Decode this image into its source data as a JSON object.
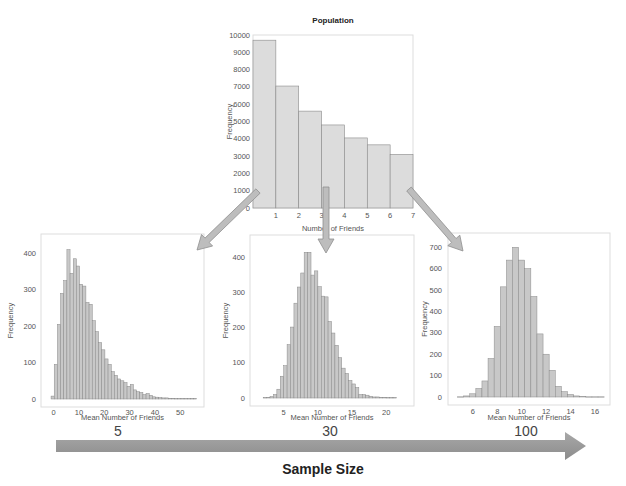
{
  "colors": {
    "bar_fill_population": "#dcdcdc",
    "bar_fill_sample": "#c8c8c8",
    "bar_stroke": "#8a8a8a",
    "frame": "#dddddd",
    "tick_text": "#555555",
    "arrow_fill": "#bdbdbd",
    "arrow_stroke": "#8f8f8f",
    "big_arrow": "#9a9a9a"
  },
  "chart_data": [
    {
      "id": "population",
      "type": "bar",
      "title": "Population",
      "xlabel": "Number of Friends",
      "ylabel": "Frequency",
      "categories": [
        "0-1",
        "1-2",
        "2-3",
        "3-4",
        "4-5",
        "5-6",
        "6-7"
      ],
      "bin_edges": [
        0,
        1,
        2,
        3,
        4,
        5,
        6,
        7
      ],
      "values": [
        9700,
        7050,
        5600,
        4800,
        4050,
        3650,
        3100
      ],
      "xticks": [
        1,
        2,
        3,
        4,
        5,
        6,
        7
      ],
      "yticks": [
        0,
        1000,
        2000,
        3000,
        4000,
        5000,
        6000,
        7000,
        8000,
        9000,
        10000
      ],
      "xlim": [
        0,
        7
      ],
      "ylim": [
        0,
        10000
      ],
      "grid": false
    },
    {
      "id": "sample5",
      "type": "bar",
      "title": "",
      "caption": "5",
      "xlabel": "Mean Number of Friends",
      "ylabel": "Frequency",
      "bin_start": -1.0,
      "bin_width": 1.25,
      "values": [
        8,
        95,
        205,
        290,
        325,
        410,
        345,
        385,
        365,
        315,
        310,
        265,
        260,
        215,
        185,
        155,
        135,
        110,
        95,
        75,
        65,
        55,
        50,
        45,
        35,
        40,
        25,
        20,
        18,
        12,
        15,
        10,
        6,
        5,
        4,
        3,
        3,
        2,
        2,
        1,
        1,
        1,
        1,
        1,
        1,
        1
      ],
      "xticks": [
        0,
        10,
        20,
        30,
        40,
        50
      ],
      "yticks": [
        0,
        100,
        200,
        300,
        400
      ],
      "xlim": [
        -3,
        57
      ],
      "ylim": [
        0,
        420
      ],
      "grid": false
    },
    {
      "id": "sample30",
      "type": "bar",
      "title": "",
      "caption": "30",
      "xlabel": "Mean Number of Friends",
      "ylabel": "Frequency",
      "bin_start": 2.0,
      "bin_width": 0.5,
      "values": [
        1,
        2,
        4,
        10,
        25,
        62,
        92,
        152,
        202,
        270,
        316,
        356,
        415,
        415,
        350,
        362,
        317,
        290,
        288,
        218,
        185,
        150,
        115,
        85,
        70,
        50,
        40,
        30,
        10,
        10,
        8,
        5,
        3,
        3,
        2,
        2,
        1,
        1,
        1
      ],
      "xticks": [
        5,
        10,
        15,
        20
      ],
      "yticks": [
        0,
        100,
        200,
        300,
        400
      ],
      "xlim": [
        0.8,
        23.2
      ],
      "ylim": [
        0,
        430
      ],
      "grid": false
    },
    {
      "id": "sample100",
      "type": "bar",
      "title": "",
      "caption": "100",
      "xlabel": "Mean Number of Friends",
      "ylabel": "Frequency",
      "bin_start": 4.75,
      "bin_width": 0.5,
      "values": [
        1,
        5,
        15,
        40,
        75,
        180,
        330,
        515,
        640,
        700,
        640,
        600,
        470,
        295,
        200,
        125,
        50,
        25,
        12,
        5,
        2,
        1,
        1,
        1
      ],
      "xticks": [
        6,
        8,
        10,
        12,
        14,
        16
      ],
      "yticks": [
        0,
        100,
        200,
        300,
        400,
        500,
        600,
        700
      ],
      "xlim": [
        4.3,
        16.9
      ],
      "ylim": [
        0,
        720
      ],
      "grid": false
    }
  ],
  "captions": {
    "population_title": "Population",
    "size_5": "5",
    "size_30": "30",
    "size_100": "100",
    "sample_size_axis": "Sample Size"
  }
}
